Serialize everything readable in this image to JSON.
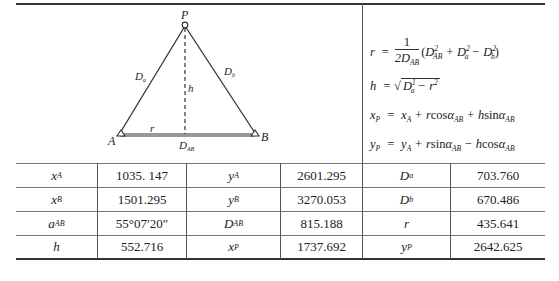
{
  "diagram": {
    "points": {
      "P": "P",
      "A": "A",
      "B": "B"
    },
    "labels": {
      "Da": "D",
      "Da_sub": "a",
      "Db": "D",
      "Db_sub": "b",
      "h": "h",
      "r": "r",
      "DAB": "D",
      "DAB_sub": "AB"
    }
  },
  "formulas": [
    "r = 1/(2D_AB) (D_AB² + D_a² − D_b²)",
    "h = √(D_a² − r²)",
    "x_P = x_A + r cosα_AB + h sinα_AB",
    "y_P = y_A + r sinα_AB − h cosα_AB"
  ],
  "table": {
    "rows": [
      [
        {
          "sym": "x",
          "sub": "A"
        },
        "1035. 147",
        {
          "sym": "y",
          "sub": "A"
        },
        "2601.295",
        {
          "sym": "D",
          "sub": "a"
        },
        "703.760"
      ],
      [
        {
          "sym": "x",
          "sub": "B"
        },
        "1501.295",
        {
          "sym": "y",
          "sub": "B"
        },
        "3270.053",
        {
          "sym": "D",
          "sub": "b"
        },
        "670.486"
      ],
      [
        {
          "sym": "a",
          "sub": "AB"
        },
        "55°07′20″",
        {
          "sym": "D",
          "sub": "AB"
        },
        "815.188",
        {
          "sym": "r",
          "sub": ""
        },
        "435.641"
      ],
      [
        {
          "sym": "h",
          "sub": ""
        },
        "552.716",
        {
          "sym": "x",
          "sub": "P"
        },
        "1737.692",
        {
          "sym": "y",
          "sub": "P"
        },
        "2642.625"
      ]
    ],
    "values": {
      "xA": "1035. 147",
      "yA": "2601.295",
      "Da": "703.760",
      "xB": "1501.295",
      "yB": "3270.053",
      "Db": "670.486",
      "aAB": "55°07′20″",
      "DAB": "815.188",
      "r": "435.641",
      "h": "552.716",
      "xP": "1737.692",
      "yP": "2642.625"
    },
    "symbols": {
      "xA": "x",
      "xA_sub": "A",
      "yA": "y",
      "yA_sub": "A",
      "Da": "D",
      "Da_sub": "a",
      "xB": "x",
      "xB_sub": "B",
      "yB": "y",
      "yB_sub": "B",
      "Db": "D",
      "Db_sub": "b",
      "aAB": "a",
      "aAB_sub": "AB",
      "DAB": "D",
      "DAB_sub": "AB",
      "r": "r",
      "h": "h",
      "xP": "x",
      "xP_sub": "P",
      "yP": "y",
      "yP_sub": "P"
    }
  }
}
